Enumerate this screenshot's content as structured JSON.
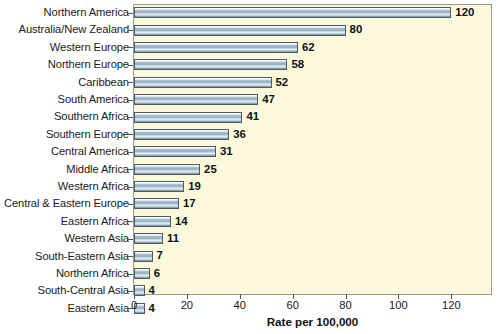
{
  "chart_data": {
    "type": "bar",
    "orientation": "horizontal",
    "title": "",
    "xlabel": "Rate per 100,000",
    "ylabel": "",
    "xlim": [
      0,
      135
    ],
    "xticks": [
      0,
      20,
      40,
      60,
      80,
      100,
      120
    ],
    "grid": false,
    "legend": null,
    "categories": [
      "Northern America",
      "Australia/New Zealand",
      "Western Europe",
      "Northern Europe",
      "Caribbean",
      "South America",
      "Southern Africa",
      "Southern Europe",
      "Central America",
      "Middle Africa",
      "Western Africa",
      "Central & Eastern Europe",
      "Eastern Africa",
      "Western Asia",
      "South-Eastern Asia",
      "Northern Africa",
      "South-Central Asia",
      "Eastern Asia"
    ],
    "values": [
      120,
      80,
      62,
      58,
      52,
      47,
      41,
      36,
      31,
      25,
      19,
      17,
      14,
      11,
      7,
      6,
      4,
      4
    ],
    "value_labels": [
      "120",
      "80",
      "62",
      "58",
      "52",
      "47",
      "41",
      "36",
      "31",
      "25",
      "19",
      "17",
      "14",
      "11",
      "7",
      "6",
      "4",
      "4"
    ],
    "colors": {
      "plot_background": "#fbf8db",
      "page_background": "#ffffff",
      "bar_fill_light": "#eaf1f5",
      "bar_fill_mid": "#8fabbd",
      "bar_outline": "#4c5a63",
      "axis": "#55554c",
      "text": "#1a1a1a"
    }
  }
}
